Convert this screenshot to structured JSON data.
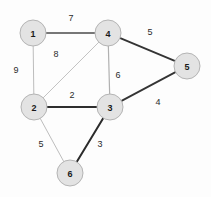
{
  "diagram": {
    "type": "weighted-undirected-graph",
    "background_color": "#fdfdfd",
    "node_fill": "#e3e3e3",
    "node_stroke": "#b4b4b4",
    "nodes": [
      {
        "id": "1",
        "label": "1",
        "x": 33,
        "y": 33,
        "r": 13
      },
      {
        "id": "2",
        "label": "2",
        "x": 34,
        "y": 107,
        "r": 13
      },
      {
        "id": "3",
        "label": "3",
        "x": 110,
        "y": 107,
        "r": 13
      },
      {
        "id": "4",
        "label": "4",
        "x": 108,
        "y": 33,
        "r": 13
      },
      {
        "id": "5",
        "label": "5",
        "x": 187,
        "y": 66,
        "r": 13
      },
      {
        "id": "6",
        "label": "6",
        "x": 70,
        "y": 173,
        "r": 13
      }
    ],
    "edges": [
      {
        "from": "1",
        "to": "4",
        "weight": "7",
        "label_x": 71,
        "label_y": 18,
        "color": "#777777",
        "width": 2.2
      },
      {
        "from": "1",
        "to": "2",
        "weight": "9",
        "label_x": 16,
        "label_y": 70,
        "color": "#bdbdbd",
        "width": 1.0
      },
      {
        "from": "2",
        "to": "4",
        "weight": "8",
        "label_x": 56,
        "label_y": 54,
        "color": "#c3c3c3",
        "width": 1.0
      },
      {
        "from": "4",
        "to": "3",
        "weight": "6",
        "label_x": 118,
        "label_y": 75,
        "color": "#b0b0b0",
        "width": 1.2
      },
      {
        "from": "4",
        "to": "5",
        "weight": "5",
        "label_x": 150,
        "label_y": 32,
        "color": "#343434",
        "width": 1.8
      },
      {
        "from": "2",
        "to": "3",
        "weight": "2",
        "label_x": 72,
        "label_y": 95,
        "color": "#2e2e2e",
        "width": 1.8
      },
      {
        "from": "3",
        "to": "5",
        "weight": "4",
        "label_x": 158,
        "label_y": 102,
        "color": "#343434",
        "width": 1.8
      },
      {
        "from": "2",
        "to": "6",
        "weight": "5",
        "label_x": 41,
        "label_y": 144,
        "color": "#bdbdbd",
        "width": 1.0
      },
      {
        "from": "3",
        "to": "6",
        "weight": "3",
        "label_x": 100,
        "label_y": 144,
        "color": "#2b2b2b",
        "width": 2.0
      }
    ]
  }
}
